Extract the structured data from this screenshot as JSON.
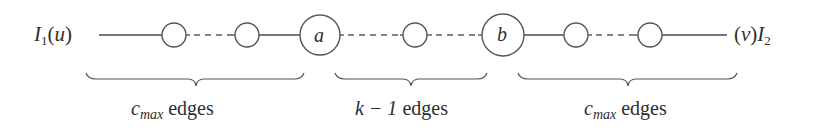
{
  "diagram": {
    "type": "path-graph",
    "left_terminal": {
      "set": "I",
      "set_subscript": "1",
      "vertex": "u",
      "label_text": "I1(u)"
    },
    "right_terminal": {
      "set": "I",
      "set_subscript": "2",
      "vertex": "v",
      "label_text": "(v)I2"
    },
    "nodes": [
      {
        "id": "n1",
        "label": "",
        "cx": 174,
        "cy": 35,
        "r": 12
      },
      {
        "id": "n2",
        "label": "",
        "cx": 247,
        "cy": 35,
        "r": 12
      },
      {
        "id": "a",
        "label": "a",
        "cx": 320,
        "cy": 35,
        "r": 20
      },
      {
        "id": "n3",
        "label": "",
        "cx": 415,
        "cy": 35,
        "r": 12
      },
      {
        "id": "b",
        "label": "b",
        "cx": 503,
        "cy": 35,
        "r": 21
      },
      {
        "id": "n4",
        "label": "",
        "cx": 576,
        "cy": 35,
        "r": 12
      },
      {
        "id": "n5",
        "label": "",
        "cx": 650,
        "cy": 35,
        "r": 12
      }
    ],
    "edges": [
      {
        "from": "u",
        "to": "n1",
        "style": "solid"
      },
      {
        "from": "n1",
        "to": "n2",
        "style": "dashed"
      },
      {
        "from": "n2",
        "to": "a",
        "style": "solid"
      },
      {
        "from": "a",
        "to": "n3",
        "style": "dashed"
      },
      {
        "from": "n3",
        "to": "b",
        "style": "dashed"
      },
      {
        "from": "b",
        "to": "n4",
        "style": "solid"
      },
      {
        "from": "n4",
        "to": "n5",
        "style": "dashed"
      },
      {
        "from": "n5",
        "to": "v",
        "style": "solid"
      }
    ],
    "braces": [
      {
        "id": "left",
        "x1": 86,
        "x2": 304,
        "label_math": "c",
        "label_subscript": "max",
        "label_word": "edges",
        "label_text": "c_max edges"
      },
      {
        "id": "middle",
        "x1": 335,
        "x2": 487,
        "label_math": "k − 1",
        "label_word": "edges",
        "label_text": "k − 1 edges"
      },
      {
        "id": "right",
        "x1": 518,
        "x2": 737,
        "label_math": "c",
        "label_subscript": "max",
        "label_word": "edges",
        "label_text": "c_max edges"
      }
    ]
  },
  "colors": {
    "line": "#4a4a4a",
    "node_stroke": "#555555",
    "text": "#2e2e2e",
    "background": "#ffffff"
  }
}
